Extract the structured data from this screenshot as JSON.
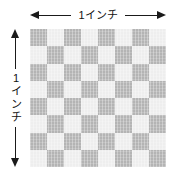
{
  "diagram": {
    "horizontal_dimension": {
      "label": "1インチ",
      "arrow_left": "arrow-left-icon",
      "arrow_right": "arrow-right-icon"
    },
    "vertical_dimension": {
      "label_chars": [
        "1",
        "イ",
        "ン",
        "チ"
      ],
      "label": "1インチ",
      "arrow_up": "arrow-up-icon",
      "arrow_down": "arrow-down-icon"
    },
    "swatch": {
      "columns": 8,
      "rows": 8,
      "dark_color": "#b4b4b4",
      "light_color": "#eeeeee",
      "background_color": "#ffffff"
    }
  }
}
